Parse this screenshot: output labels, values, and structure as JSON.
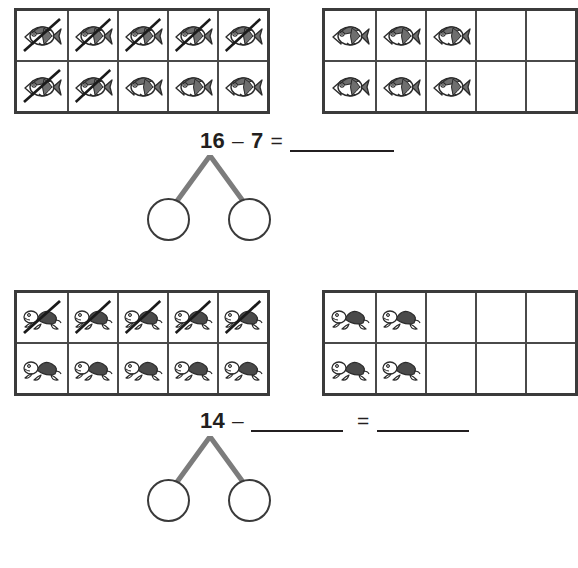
{
  "worksheet": {
    "title": "Subtraction Ten-Frame Worksheet",
    "background_color": "#ffffff",
    "ink_color": "#231f20",
    "frame_border_color": "#3b3b3b",
    "bond_branch_color": "#7c7c7c"
  },
  "problems": [
    {
      "id": "problem-1",
      "icon_name": "fish-icon",
      "icon_label": "fish",
      "frames": [
        {
          "id": "problem-1-frame-1",
          "name": "ten-frame-left",
          "rows": [
            [
              "crossed",
              "crossed",
              "crossed",
              "crossed",
              "crossed"
            ],
            [
              "crossed",
              "crossed",
              "filled",
              "filled",
              "filled"
            ]
          ]
        },
        {
          "id": "problem-1-frame-2",
          "name": "ten-frame-right",
          "rows": [
            [
              "filled",
              "filled",
              "filled",
              "empty",
              "empty"
            ],
            [
              "filled",
              "filled",
              "filled",
              "empty",
              "empty"
            ]
          ]
        }
      ],
      "equation": {
        "minuend": "16",
        "minus_sign": "–",
        "subtrahend": "7",
        "equals_sign": "=",
        "answer_blank": "",
        "answer_blank_visible": true,
        "subtrahend_blank_visible": false
      },
      "number_bond": {
        "name": "number-bond-1",
        "left_circle_value": "",
        "right_circle_value": ""
      }
    },
    {
      "id": "problem-2",
      "icon_name": "turtle-icon",
      "icon_label": "turtle",
      "frames": [
        {
          "id": "problem-2-frame-1",
          "name": "ten-frame-left",
          "rows": [
            [
              "crossed",
              "crossed",
              "crossed",
              "crossed",
              "crossed"
            ],
            [
              "filled",
              "filled",
              "filled",
              "filled",
              "filled"
            ]
          ]
        },
        {
          "id": "problem-2-frame-2",
          "name": "ten-frame-right",
          "rows": [
            [
              "filled",
              "filled",
              "empty",
              "empty",
              "empty"
            ],
            [
              "filled",
              "filled",
              "empty",
              "empty",
              "empty"
            ]
          ]
        }
      ],
      "equation": {
        "minuend": "14",
        "minus_sign": "–",
        "subtrahend": "",
        "equals_sign": "=",
        "answer_blank": "",
        "answer_blank_visible": true,
        "subtrahend_blank_visible": true
      },
      "number_bond": {
        "name": "number-bond-2",
        "left_circle_value": "",
        "right_circle_value": ""
      }
    }
  ]
}
